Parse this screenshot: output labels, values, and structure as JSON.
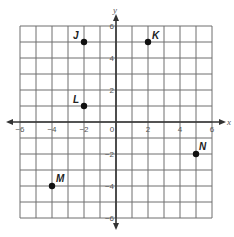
{
  "plane": {
    "x_axis_label": "x",
    "y_axis_label": "y",
    "x_range": [
      -6,
      6
    ],
    "y_range": [
      -6,
      6
    ],
    "grid_step": 1,
    "x_tick_labels": [
      {
        "value": -6,
        "text": "−6"
      },
      {
        "value": -4,
        "text": "−4"
      },
      {
        "value": -2,
        "text": "−2"
      },
      {
        "value": 0,
        "text": "0"
      },
      {
        "value": 2,
        "text": "2"
      },
      {
        "value": 4,
        "text": "4"
      },
      {
        "value": 6,
        "text": "6"
      }
    ],
    "y_tick_labels": [
      {
        "value": 6,
        "text": "6"
      },
      {
        "value": 4,
        "text": "4"
      },
      {
        "value": 2,
        "text": "2"
      },
      {
        "value": -2,
        "text": "−2"
      },
      {
        "value": -4,
        "text": "−4"
      },
      {
        "value": -6,
        "text": "−6"
      }
    ]
  },
  "points": [
    {
      "label": "J",
      "x": -2,
      "y": 5,
      "label_dx": -11,
      "label_dy": -3
    },
    {
      "label": "K",
      "x": 2,
      "y": 5,
      "label_dx": 4,
      "label_dy": -3
    },
    {
      "label": "L",
      "x": -2,
      "y": 1,
      "label_dx": -11,
      "label_dy": -3
    },
    {
      "label": "M",
      "x": -4,
      "y": -4,
      "label_dx": 4,
      "label_dy": -4
    },
    {
      "label": "N",
      "x": 5,
      "y": -2,
      "label_dx": 3,
      "label_dy": -4
    }
  ],
  "colors": {
    "grid": "#6e6e6e",
    "axis": "#333333",
    "point": "#111111"
  }
}
